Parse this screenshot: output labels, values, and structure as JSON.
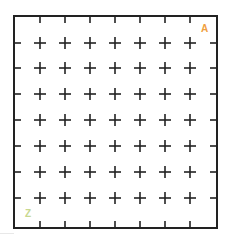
{
  "board": {
    "columns": 8,
    "rows": 8,
    "border_color": "#222222",
    "line_color": "#222222",
    "background": "#ffffff",
    "border": {
      "left": 14,
      "top": 16,
      "right": 217,
      "bottom": 228
    },
    "col_lines_x": [
      40,
      65,
      90,
      115,
      140,
      165,
      190
    ],
    "row_lines_y": [
      43,
      68,
      94,
      120,
      146,
      172,
      198
    ]
  },
  "labels": {
    "top_right": {
      "text": "A",
      "color": "#f0a040"
    },
    "bottom_left": {
      "text": "Z",
      "color": "#c8d890"
    }
  }
}
